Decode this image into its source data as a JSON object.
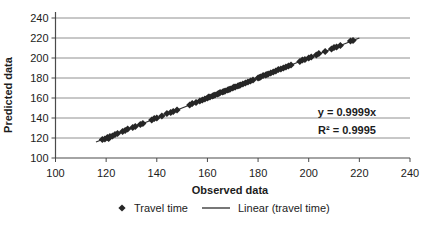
{
  "theme": {
    "background": "#ffffff",
    "text_color": "#1c1c1c",
    "gridline_color": "#909090",
    "axis_color": "#4a4a4a",
    "marker_color": "#262626",
    "trendline_color": "#2e2e2e"
  },
  "chart_data": {
    "type": "scatter",
    "title": "",
    "xlabel": "Observed data",
    "ylabel": "Predicted data",
    "xlim": [
      100,
      240
    ],
    "ylim": [
      100,
      240
    ],
    "xticks": [
      100,
      120,
      140,
      160,
      180,
      200,
      220,
      240
    ],
    "yticks": [
      100,
      120,
      140,
      160,
      180,
      200,
      220,
      240
    ],
    "grid": "horizontal-only",
    "legend_position": "bottom-center",
    "series": [
      {
        "name": "Travel time",
        "type": "scatter",
        "marker": "diamond",
        "points": [
          [
            118.5,
            118.5
          ],
          [
            119.5,
            119
          ],
          [
            120.5,
            120.5
          ],
          [
            121,
            119.5
          ],
          [
            121.5,
            121.5
          ],
          [
            122.5,
            122
          ],
          [
            123.5,
            123.5
          ],
          [
            124.5,
            124.5
          ],
          [
            126.5,
            126.5
          ],
          [
            127.5,
            127.5
          ],
          [
            128.5,
            129
          ],
          [
            130.5,
            130.5
          ],
          [
            131.5,
            131.5
          ],
          [
            133.5,
            133.5
          ],
          [
            134.5,
            134.5
          ],
          [
            138,
            138
          ],
          [
            139,
            139.5
          ],
          [
            140,
            140
          ],
          [
            142,
            142
          ],
          [
            144,
            144.5
          ],
          [
            145.5,
            145.5
          ],
          [
            146.5,
            146.5
          ],
          [
            148,
            148
          ],
          [
            153,
            153
          ],
          [
            154,
            154.5
          ],
          [
            155.5,
            155.5
          ],
          [
            157,
            157
          ],
          [
            158,
            158
          ],
          [
            159,
            159
          ],
          [
            160,
            160
          ],
          [
            160.5,
            161
          ],
          [
            161,
            161
          ],
          [
            162,
            162
          ],
          [
            162.5,
            162.5
          ],
          [
            163,
            163
          ],
          [
            164,
            164
          ],
          [
            164.5,
            164.5
          ],
          [
            165,
            165.5
          ],
          [
            166,
            166
          ],
          [
            166.5,
            166.5
          ],
          [
            167,
            167
          ],
          [
            168,
            168
          ],
          [
            168.5,
            168.5
          ],
          [
            169,
            169
          ],
          [
            170,
            170
          ],
          [
            170.5,
            171
          ],
          [
            171,
            171
          ],
          [
            172,
            172
          ],
          [
            172.5,
            172.5
          ],
          [
            173,
            173
          ],
          [
            174,
            174
          ],
          [
            175,
            175
          ],
          [
            176,
            176
          ],
          [
            177,
            177
          ],
          [
            178,
            178
          ],
          [
            180,
            180
          ],
          [
            180.5,
            180.5
          ],
          [
            181,
            181
          ],
          [
            182,
            182.5
          ],
          [
            183,
            183
          ],
          [
            183.5,
            183.5
          ],
          [
            184,
            184
          ],
          [
            185,
            185
          ],
          [
            186,
            186
          ],
          [
            187,
            187
          ],
          [
            188,
            188.5
          ],
          [
            189,
            189
          ],
          [
            190,
            190
          ],
          [
            191,
            191
          ],
          [
            192,
            192
          ],
          [
            193,
            193
          ],
          [
            196.5,
            196.5
          ],
          [
            197.5,
            198
          ],
          [
            198.5,
            198.5
          ],
          [
            200,
            200
          ],
          [
            201,
            201
          ],
          [
            203,
            203
          ],
          [
            204,
            204.5
          ],
          [
            206.5,
            206.5
          ],
          [
            209,
            209
          ],
          [
            210,
            210.5
          ],
          [
            211,
            211
          ],
          [
            212.5,
            212.5
          ],
          [
            216.5,
            217
          ],
          [
            217.5,
            217.5
          ]
        ]
      },
      {
        "name": "Linear (travel time)",
        "type": "line",
        "x": [
          116,
          220
        ],
        "y": [
          115.99,
          219.98
        ]
      }
    ],
    "annotations": [
      {
        "text": "y = 0.9999x"
      },
      {
        "text": "R² = 0.9995"
      }
    ]
  },
  "legend": {
    "items": [
      {
        "label": "Travel time",
        "marker": "diamond"
      },
      {
        "label": "Linear (travel time)",
        "marker": "line"
      }
    ]
  }
}
